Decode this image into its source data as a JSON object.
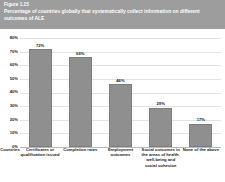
{
  "header": {
    "figure_number": "Figure 1.15",
    "title": "Percentage of countries globally that systematically collect information on different outcomes of ALE",
    "banner_color": "#9d9d9d",
    "text_color": "#ffffff"
  },
  "axis": {
    "y_ticks": [
      "80%",
      "70%",
      "60%",
      "50%",
      "40%",
      "30%",
      "20%",
      "10%",
      "0%"
    ],
    "y_origin_label": "Countries"
  },
  "chart_data": {
    "type": "bar",
    "title": "Percentage of countries globally that systematically collect information on different outcomes of ALE",
    "xlabel": "",
    "ylabel": "",
    "ylim": [
      0,
      80
    ],
    "grid": true,
    "legend": "none",
    "axis_origin_category": "Countries",
    "categories": [
      "Certificates or qualification issued",
      "Completion rates",
      "Employment outcomes",
      "Social outcomes in the areas of health, well-being and social cohesion",
      "None of the above"
    ],
    "values": [
      72,
      66,
      46,
      29,
      17
    ],
    "value_labels": [
      "72%",
      "66%",
      "46%",
      "29%",
      "17%"
    ],
    "bar_color": "#8f8f8f"
  }
}
